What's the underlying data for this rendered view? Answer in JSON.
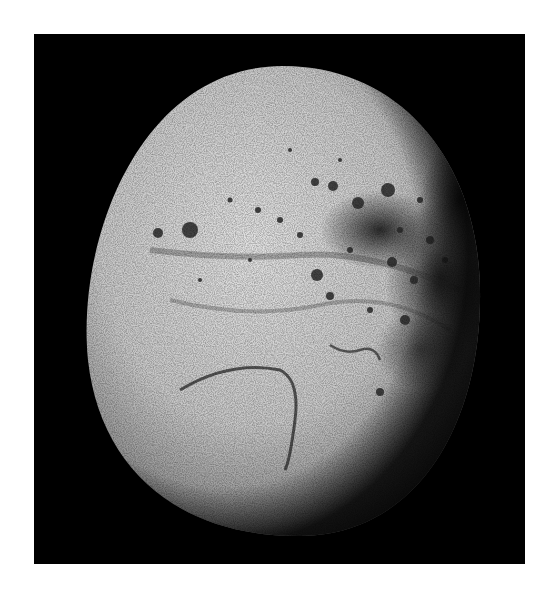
{
  "image": {
    "subject": "Moon Iapetus (grayscale photograph)",
    "background_color": "#000000",
    "page_color": "#ffffff"
  },
  "moon": {
    "center": [
      283,
      300
    ],
    "radii": [
      196,
      234
    ],
    "surface_light": "#d8d8d8",
    "surface_dark": "#1a1a1a"
  }
}
